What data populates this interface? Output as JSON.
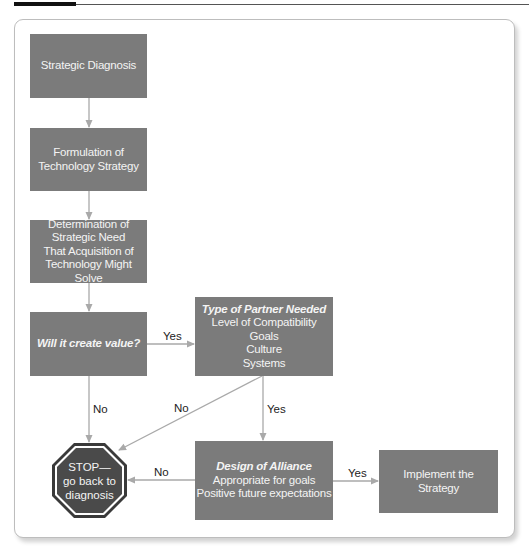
{
  "diagram": {
    "nodes": {
      "strategic_diagnosis": {
        "label": "Strategic Diagnosis"
      },
      "formulation": {
        "line1": "Formulation of",
        "line2": "Technology Strategy"
      },
      "determination": {
        "line1": "Determination of",
        "line2": "Strategic Need",
        "line3": "That Acquisition of",
        "line4": "Technology Might Solve"
      },
      "create_value": {
        "label": "Will it create value?"
      },
      "partner": {
        "title": "Type of Partner Needed",
        "items": [
          "Level of Compatibility",
          "Goals",
          "Culture",
          "Systems"
        ]
      },
      "alliance": {
        "title": "Design of Alliance",
        "items": [
          "Appropriate for goals",
          "Positive future expectations"
        ]
      },
      "implement": {
        "line1": "Implement the",
        "line2": "Strategy"
      },
      "stop": {
        "line1": "STOP—",
        "line2": "go back to",
        "line3": "diagnosis"
      }
    },
    "edge_labels": {
      "value_yes": "Yes",
      "value_no": "No",
      "partner_no": "No",
      "partner_yes": "Yes",
      "alliance_no": "No",
      "alliance_yes": "Yes"
    },
    "colors": {
      "box_fill": "#7b7b7b",
      "stop_fill": "#4a4a4a",
      "connector": "#a9a9a9",
      "box_text": "#f4f4f4"
    }
  }
}
